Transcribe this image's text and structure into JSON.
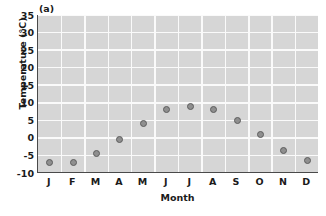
{
  "figure": {
    "panel_label": "(a)"
  },
  "chart_data": {
    "type": "scatter",
    "title": "",
    "panel_label": "(a)",
    "xlabel": "Month",
    "ylabel": "Temperature (°C)",
    "categories": [
      "J",
      "F",
      "M",
      "A",
      "M",
      "J",
      "J",
      "A",
      "S",
      "O",
      "N",
      "D"
    ],
    "category_full_names": [
      "January",
      "February",
      "March",
      "April",
      "May",
      "June",
      "July",
      "August",
      "September",
      "October",
      "November",
      "December"
    ],
    "values": [
      -7,
      -7,
      -4.5,
      -0.5,
      4,
      8,
      9,
      8,
      5,
      1,
      -3.5,
      -6.5
    ],
    "ylim": [
      -10,
      35
    ],
    "ytick_values": [
      35,
      30,
      25,
      20,
      15,
      10,
      5,
      0,
      -5,
      -10
    ],
    "ytick_labels": [
      "35",
      "30",
      "25",
      "20",
      "15",
      "10",
      "5",
      "0",
      "-5",
      "-10"
    ],
    "ytick_step": 5,
    "grid": true,
    "grid_color": "#fafafa",
    "plot_background": "#d6d6d6",
    "marker_fill": "#8f8f8f",
    "marker_edge": "#5d5d5d",
    "axis_color": "#4a4a4a",
    "legend": null,
    "units": "°C"
  }
}
